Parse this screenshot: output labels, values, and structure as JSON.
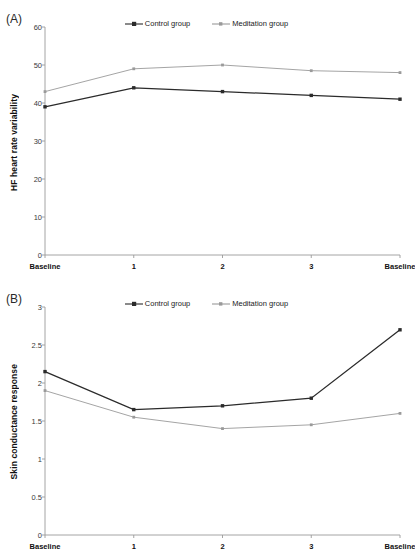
{
  "figure": {
    "background": "#ffffff",
    "panels": [
      {
        "id": "A",
        "label": "(A)",
        "chart_data": {
          "type": "line",
          "title": "",
          "xlabel": "",
          "ylabel": "HF heart rate variability",
          "categories": [
            "Baseline",
            "1",
            "2",
            "3",
            "Baseline"
          ],
          "yticks": [
            "0",
            "10",
            "20",
            "30",
            "40",
            "50",
            "60"
          ],
          "ylim": [
            0,
            60
          ],
          "grid": false,
          "legend_position": "top-center",
          "series": [
            {
              "name": "Control group",
              "color": "#2b2b2b",
              "marker": "square",
              "values": [
                39,
                44,
                43,
                42,
                41
              ]
            },
            {
              "name": "Meditation group",
              "color": "#9a9a9a",
              "marker": "square",
              "values": [
                43,
                49,
                50,
                48.5,
                48
              ]
            }
          ]
        }
      },
      {
        "id": "B",
        "label": "(B)",
        "chart_data": {
          "type": "line",
          "title": "",
          "xlabel": "",
          "ylabel": "Skin conductance response",
          "categories": [
            "Baseline",
            "1",
            "2",
            "3",
            "Baseline"
          ],
          "yticks": [
            "0",
            "0.5",
            "1",
            "1.5",
            "2",
            "2.5",
            "3"
          ],
          "ylim": [
            0,
            3
          ],
          "grid": false,
          "legend_position": "top-center",
          "series": [
            {
              "name": "Control group",
              "color": "#2b2b2b",
              "marker": "square",
              "values": [
                2.15,
                1.65,
                1.7,
                1.8,
                2.7
              ]
            },
            {
              "name": "Meditation group",
              "color": "#9a9a9a",
              "marker": "square",
              "values": [
                1.9,
                1.55,
                1.4,
                1.45,
                1.6
              ]
            }
          ]
        }
      }
    ],
    "legend_labels": {
      "control": "Control group",
      "meditation": "Meditation group"
    },
    "colors": {
      "control": "#2b2b2b",
      "meditation": "#9a9a9a",
      "axis": "#9a9a9a",
      "text": "#1a1a1a"
    }
  }
}
